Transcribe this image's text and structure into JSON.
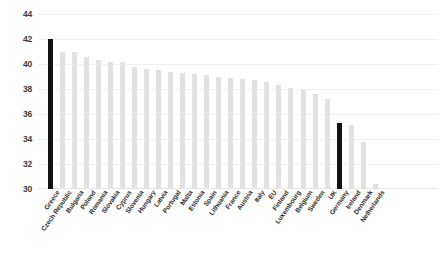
{
  "chart_data": {
    "type": "bar",
    "title": "",
    "xlabel": "",
    "ylabel": "",
    "ylim": [
      30,
      44
    ],
    "ytick_step": 2,
    "yticks": [
      44,
      42,
      40,
      38,
      36,
      34,
      32,
      30
    ],
    "grid": true,
    "legend": "none",
    "bar_color": "#e2e2e2",
    "highlight_color": "#111111",
    "highlighted_categories": [
      "Greece",
      "Germany"
    ],
    "categories": [
      "Greece",
      "Czech Republic",
      "Bulgaria",
      "Poland",
      "Romania",
      "Slovakia",
      "Cyprus",
      "Slovenia",
      "Hungary",
      "Latvia",
      "Portugal",
      "Malta",
      "Estonia",
      "Spain",
      "Lithuania",
      "France",
      "Austria",
      "Italy",
      "EU",
      "Finland",
      "Luxembourg",
      "Belgium",
      "Sweden",
      "UK",
      "Germany",
      "Ireland",
      "Denmark",
      "Netherlands"
    ],
    "values": [
      42.0,
      41.0,
      41.0,
      40.6,
      40.3,
      40.2,
      40.2,
      39.8,
      39.6,
      39.5,
      39.4,
      39.3,
      39.2,
      39.1,
      39.0,
      38.9,
      38.8,
      38.7,
      38.6,
      38.3,
      38.1,
      37.9,
      37.6,
      37.2,
      35.3,
      35.1,
      33.8,
      30.4
    ]
  }
}
